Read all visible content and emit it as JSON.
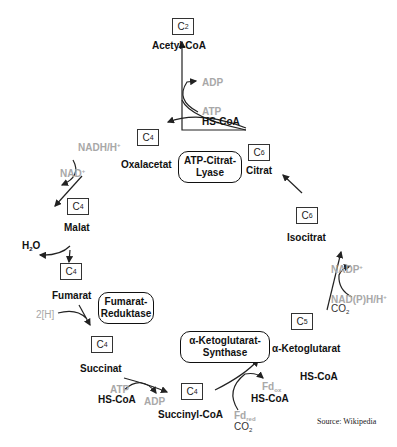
{
  "source": "Source: Wikipedia",
  "metabolites": [
    {
      "id": "acetyl-coa",
      "name": "Acetyl-CoA",
      "carbon": "C",
      "carbon_sub": "2"
    },
    {
      "id": "citrat",
      "name": "Citrat",
      "carbon": "C",
      "carbon_sub": "6"
    },
    {
      "id": "isocitrat",
      "name": "Isocitrat",
      "carbon": "C",
      "carbon_sub": "6"
    },
    {
      "id": "ketoglutarat",
      "name": "α-Ketoglutarat",
      "carbon": "C",
      "carbon_sub": "5"
    },
    {
      "id": "succinyl-coa",
      "name": "Succinyl-CoA",
      "carbon": "C",
      "carbon_sub": "4"
    },
    {
      "id": "succinat",
      "name": "Succinat",
      "carbon": "C",
      "carbon_sub": "4"
    },
    {
      "id": "fumarat",
      "name": "Fumarat",
      "carbon": "C",
      "carbon_sub": "4"
    },
    {
      "id": "malat",
      "name": "Malat",
      "carbon": "C",
      "carbon_sub": "4"
    },
    {
      "id": "oxalacetat",
      "name": "Oxalacetat",
      "carbon": "C",
      "carbon_sub": "4"
    }
  ],
  "enzymes": [
    {
      "id": "atp-citrat-lyase",
      "line1": "ATP-Citrat-",
      "line2": "Lyase"
    },
    {
      "id": "fumarat-reduktase",
      "line1": "Fumarat-",
      "line2": "Reduktase"
    },
    {
      "id": "ketoglutarat-synthase",
      "line1": "α-Ketoglutarat-",
      "line2": "Synthase"
    }
  ],
  "cofactors": {
    "citrat_lyase": {
      "adp": "ADP",
      "atp": "ATP",
      "hscoa": "HS-CoA"
    },
    "oxalacetat_malat": {
      "nadh": "NADH/H",
      "nadh_sup": "+",
      "nad": "NAD",
      "nad_sup": "+"
    },
    "malat_fumarat": {
      "h2o": "H",
      "h2o_sub": "2",
      "h2o_o": "O"
    },
    "fumarat_succinat": {
      "h": "2[H]"
    },
    "succinat_succinylcoa": {
      "atp": "ATP",
      "hscoa": "HS-CoA",
      "adp": "ADP"
    },
    "succinylcoa_ketoglutarat": {
      "fd_ox": "Fd",
      "fd_ox_sub": "ox",
      "hscoa": "HS-CoA",
      "fd_red": "Fd",
      "fd_red_sub": "red",
      "co2": "CO",
      "co2_sub": "2",
      "hscoa2": "HS-CoA"
    },
    "ketoglutarat_isocitrat": {
      "nadp": "NADP",
      "nadp_sup": "+",
      "nadph": "NAD(P)H/H",
      "nadph_sup": "+",
      "co2": "CO",
      "co2_sub": "2"
    }
  }
}
